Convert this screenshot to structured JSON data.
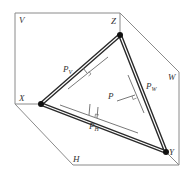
{
  "diagram": {
    "type": "trace-triangle-of-plane-in-three-projection-planes",
    "colors": {
      "background": "#ffffff",
      "frame": "#8a8a8a",
      "trace": "#2a2a2a",
      "trace_inner": "#ffffff",
      "thin": "#555555",
      "label": "#333333"
    },
    "plane_labels": {
      "V": "V",
      "W": "W",
      "H": "H"
    },
    "axis_labels": {
      "X": "X",
      "Y": "Y",
      "Z": "Z"
    },
    "trace_labels": {
      "PV": {
        "main": "P",
        "sub": "V"
      },
      "PW": {
        "main": "P",
        "sub": "W"
      },
      "PH": {
        "main": "P",
        "sub": "H"
      }
    },
    "plane_label": "P",
    "vertices": {
      "X": [
        41,
        104
      ],
      "Y": [
        166,
        152
      ],
      "Z": [
        120,
        35
      ]
    },
    "frame_points": [
      [
        15,
        13
      ],
      [
        120,
        13
      ],
      [
        179,
        72
      ],
      [
        179,
        165
      ],
      [
        73,
        165
      ],
      [
        15,
        104
      ]
    ]
  }
}
